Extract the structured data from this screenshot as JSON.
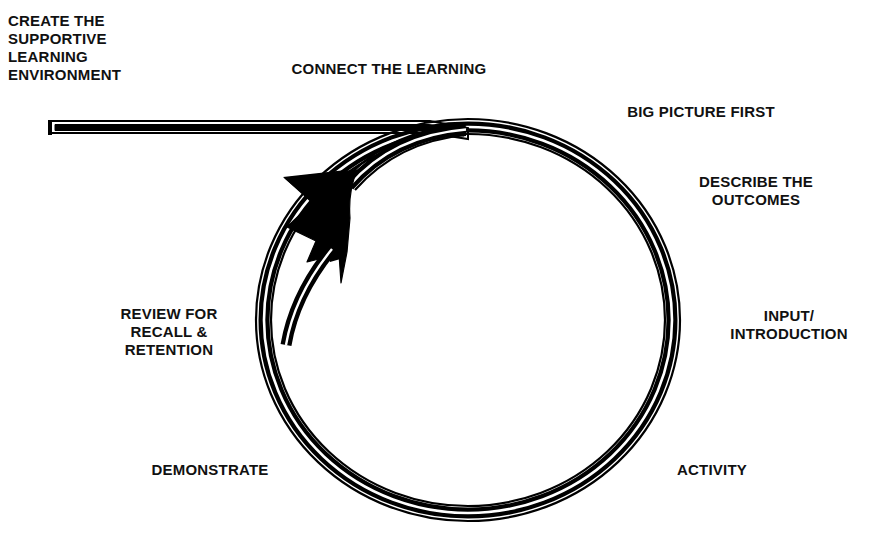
{
  "diagram": {
    "type": "cycle-diagram",
    "colors": {
      "ink": "#111111",
      "background": "#ffffff",
      "stroke": "#000000"
    },
    "entry_arrow": {
      "name": "create-supportive-learning-environment-bar",
      "shape": "horizontal-bar-into-circle",
      "label": "CREATE THE\nSUPPORTIVE\nLEARNING\nENVIRONMENT"
    },
    "cycle_arrow": {
      "name": "cycle-arrowhead",
      "direction": "clockwise",
      "head_position": "upper-left"
    },
    "steps": [
      {
        "id": "connect-the-learning",
        "label": "CONNECT THE LEARNING",
        "align": "center"
      },
      {
        "id": "big-picture-first",
        "label": "BIG PICTURE FIRST",
        "align": "center"
      },
      {
        "id": "describe-the-outcomes",
        "label": "DESCRIBE THE\nOUTCOMES",
        "align": "center"
      },
      {
        "id": "input-introduction",
        "label": "INPUT/\nINTRODUCTION",
        "align": "center"
      },
      {
        "id": "activity",
        "label": "ACTIVITY",
        "align": "center"
      },
      {
        "id": "demonstrate",
        "label": "DEMONSTRATE",
        "align": "center"
      },
      {
        "id": "review-for-recall-and-retention",
        "label": "REVIEW FOR\nRECALL &\nRETENTION",
        "align": "center"
      }
    ],
    "labels": {
      "create": "CREATE THE\nSUPPORTIVE\nLEARNING\nENVIRONMENT",
      "connect": "CONNECT THE LEARNING",
      "big_picture": "BIG PICTURE FIRST",
      "describe": "DESCRIBE THE\nOUTCOMES",
      "input": "INPUT/\nINTRODUCTION",
      "activity": "ACTIVITY",
      "demonstrate": "DEMONSTRATE",
      "review": "REVIEW FOR\nRECALL &\nRETENTION"
    }
  }
}
